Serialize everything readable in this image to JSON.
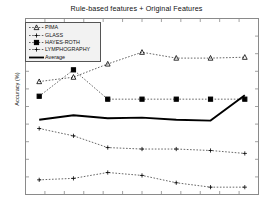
{
  "chart_data": {
    "type": "line",
    "title": "Rule-based features + Original Features",
    "xlabel": "",
    "ylabel": "Accuracy (%)",
    "x": [
      1,
      2,
      3,
      4,
      5,
      6,
      7
    ],
    "xlim": [
      0.6,
      7.4
    ],
    "ylim": [
      40,
      100
    ],
    "grid": false,
    "legend_position": "upper-left",
    "series": [
      {
        "name": "PIMA",
        "marker": "triangle",
        "linestyle": "dashed",
        "values": [
          78.5,
          80.0,
          84.5,
          88.5,
          86.5,
          86.5,
          86.8
        ]
      },
      {
        "name": "GLASS",
        "marker": "plus",
        "linestyle": "dashed",
        "values": [
          62.5,
          60.0,
          56.0,
          55.5,
          55.5,
          55.0,
          54.0
        ]
      },
      {
        "name": "HAYES-ROTH",
        "marker": "square",
        "linestyle": "dashed",
        "values": [
          73.5,
          82.5,
          72.5,
          72.5,
          72.5,
          72.5,
          72.5
        ]
      },
      {
        "name": "LYMPHOGRAPHY",
        "marker": "plus",
        "linestyle": "dashed",
        "values": [
          45.0,
          45.5,
          47.5,
          46.5,
          44.0,
          42.5,
          42.5
        ]
      },
      {
        "name": "Average",
        "marker": "none",
        "linestyle": "solid",
        "values": [
          65.5,
          67.0,
          66.0,
          66.2,
          65.5,
          65.2,
          73.8
        ]
      }
    ]
  },
  "legend": {
    "items": [
      {
        "label": "PIMA"
      },
      {
        "label": "GLASS"
      },
      {
        "label": "HAYES-ROTH"
      },
      {
        "label": "LYMPHOGRAPHY"
      },
      {
        "label": "Average"
      }
    ]
  },
  "axes": {
    "x_tick_count": 13,
    "y_tick_count": 11,
    "frame_color": "#888888"
  }
}
